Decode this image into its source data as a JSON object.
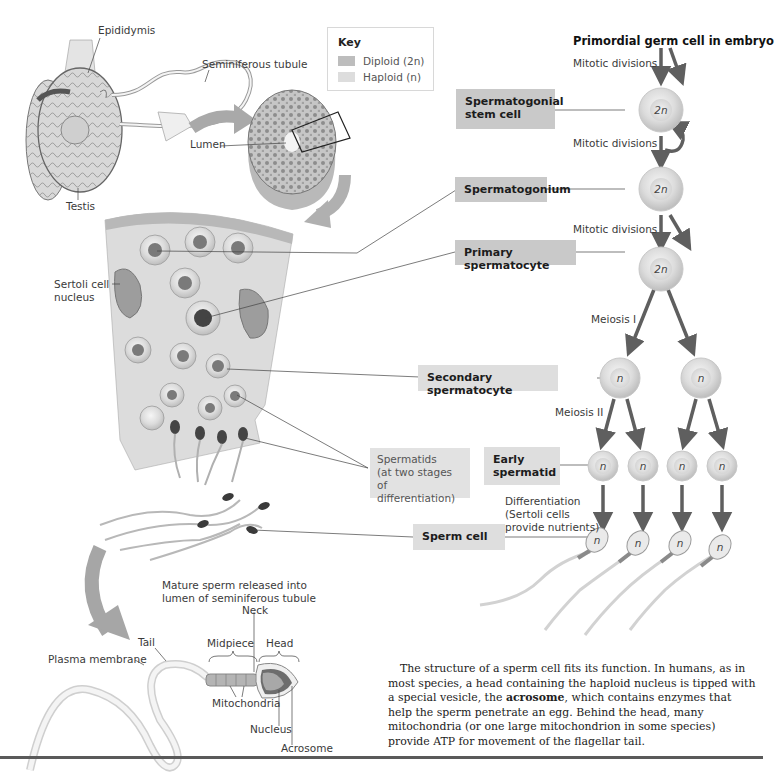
{
  "key": {
    "title": "Key",
    "items": [
      {
        "label": "Diploid (2n)",
        "color": "#bdbdbd"
      },
      {
        "label": "Haploid (n)",
        "color": "#dddddd"
      }
    ]
  },
  "anatomy_labels": {
    "epididymis": "Epididymis",
    "seminiferous_tubule": "Seminiferous tubule",
    "testis": "Testis",
    "lumen": "Lumen",
    "sertoli_cell_nucleus_line1": "Sertoli cell",
    "sertoli_cell_nucleus_line2": "nucleus",
    "mature_sperm_line1": "Mature sperm released into",
    "mature_sperm_line2": "lumen of seminiferous tubule"
  },
  "spermatids_note": {
    "line1": "Spermatids",
    "line2": "(at two stages of",
    "line3": "differentiation)"
  },
  "flow": {
    "origin": "Primordial germ cell in embryo",
    "steps": [
      {
        "process": "Mitotic divisions"
      },
      {
        "process": "Mitotic divisions"
      },
      {
        "process": "Mitotic divisions"
      },
      {
        "process": "Meiosis I"
      },
      {
        "process": "Meiosis II"
      },
      {
        "process_line1": "Differentiation",
        "process_line2": "(Sertoli cells",
        "process_line3": "provide nutrients)"
      }
    ],
    "stages": [
      {
        "line1": "Spermatogonial",
        "line2": "stem cell",
        "ploidy": "2n"
      },
      {
        "label": "Spermatogonium",
        "ploidy": "2n"
      },
      {
        "label": "Primary spermatocyte",
        "ploidy": "2n"
      },
      {
        "label": "Secondary spermatocyte",
        "ploidy": "n"
      },
      {
        "line1": "Early",
        "line2": "spermatid",
        "ploidy": "n"
      },
      {
        "label": "Sperm cell",
        "ploidy": "n"
      }
    ]
  },
  "sperm_structure": {
    "neck": "Neck",
    "tail": "Tail",
    "midpiece": "Midpiece",
    "head": "Head",
    "plasma_membrane": "Plasma membrane",
    "mitochondria": "Mitochondria",
    "nucleus": "Nucleus",
    "acrosome": "Acrosome"
  },
  "body_text": {
    "part1": "The structure of a sperm cell fits its function. In humans, as in most species, a head containing the haploid nucleus is tipped with a special vesicle, the ",
    "bold": "acrosome",
    "part2": ", which contains enzymes that help the sperm penetrate an egg. Behind the head, many mitochondria (or one large mitochondrion in some species) provide ATP for movement of the flagellar tail."
  },
  "colors": {
    "diploid_box": "#c9c9c9",
    "haploid_box": "#dedede",
    "arrow": "#5f5f5f",
    "cell_fill": "#e4e4e4"
  }
}
